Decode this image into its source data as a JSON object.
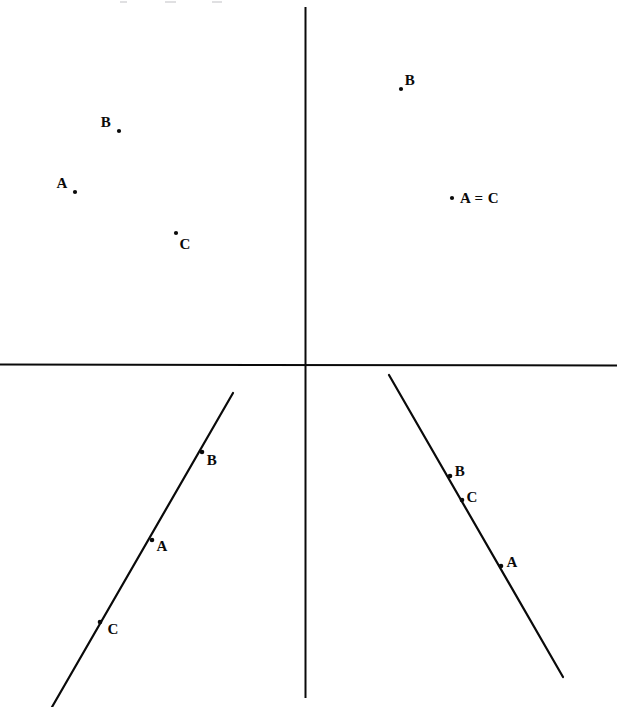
{
  "figure": {
    "background_color": "#ffffff",
    "ink_color": "#0a0a0a",
    "width": 619,
    "height": 707
  },
  "axes": {
    "origin": {
      "x": 305,
      "y": 364
    },
    "horizontal": {
      "name": "horizontal-axis",
      "x1": 0,
      "y1": 364,
      "x2": 617,
      "y2": 365,
      "stroke_width": 2
    },
    "vertical": {
      "name": "vertical-axis",
      "x1": 305,
      "y1": 7,
      "x2": 305,
      "y2": 698,
      "stroke_width": 2
    }
  },
  "point_groups": [
    {
      "name": "upper-left-scatter",
      "quadrant": "top-left",
      "points": [
        {
          "label": "B",
          "dot": {
            "x": 119,
            "y": 131
          },
          "label_pos": {
            "x": 106,
            "y": 122
          },
          "anchor": "center"
        },
        {
          "label": "A",
          "dot": {
            "x": 75,
            "y": 192
          },
          "label_pos": {
            "x": 62,
            "y": 183
          },
          "anchor": "center"
        },
        {
          "label": "C",
          "dot": {
            "x": 176,
            "y": 233
          },
          "label_pos": {
            "x": 185,
            "y": 244
          },
          "anchor": "center"
        }
      ]
    },
    {
      "name": "upper-right-scatter",
      "quadrant": "top-right",
      "points": [
        {
          "label": "B",
          "dot": {
            "x": 401,
            "y": 89
          },
          "label_pos": {
            "x": 410,
            "y": 80
          },
          "anchor": "center"
        },
        {
          "label": "A = C",
          "dot": {
            "x": 452,
            "y": 198
          },
          "label_pos": {
            "x": 460,
            "y": 198
          },
          "anchor": "left"
        }
      ]
    },
    {
      "name": "lower-left-line-points",
      "quadrant": "bottom-left",
      "points": [
        {
          "label": "B",
          "dot": {
            "x": 202,
            "y": 452
          },
          "label_pos": {
            "x": 212,
            "y": 460
          },
          "anchor": "center"
        },
        {
          "label": "A",
          "dot": {
            "x": 152,
            "y": 540
          },
          "label_pos": {
            "x": 162,
            "y": 546
          },
          "anchor": "center"
        },
        {
          "label": "C",
          "dot": {
            "x": 100,
            "y": 622
          },
          "label_pos": {
            "x": 113,
            "y": 629
          },
          "anchor": "center"
        }
      ]
    },
    {
      "name": "lower-right-line-points",
      "quadrant": "bottom-right",
      "points": [
        {
          "label": "B",
          "dot": {
            "x": 450,
            "y": 476
          },
          "label_pos": {
            "x": 460,
            "y": 471
          },
          "anchor": "center"
        },
        {
          "label": "C",
          "dot": {
            "x": 462,
            "y": 500
          },
          "label_pos": {
            "x": 472,
            "y": 497
          },
          "anchor": "center"
        },
        {
          "label": "A",
          "dot": {
            "x": 501,
            "y": 566
          },
          "label_pos": {
            "x": 512,
            "y": 562
          },
          "anchor": "center"
        }
      ]
    }
  ],
  "lines": [
    {
      "name": "lower-left-line",
      "x1": 233,
      "y1": 393,
      "x2": 52,
      "y2": 707,
      "stroke_width": 2.2,
      "description": "line with positive slope through C, A, B in the third quadrant"
    },
    {
      "name": "lower-right-line",
      "x1": 389,
      "y1": 375,
      "x2": 563,
      "y2": 677,
      "stroke_width": 2.2,
      "description": "line with negative slope through B, C, A in the fourth quadrant"
    }
  ],
  "artifacts": {
    "top_cut_text_marks": [
      {
        "x": 120,
        "y": 1,
        "w": 7
      },
      {
        "x": 165,
        "y": 1,
        "w": 11
      },
      {
        "x": 212,
        "y": 1,
        "w": 10
      }
    ]
  }
}
